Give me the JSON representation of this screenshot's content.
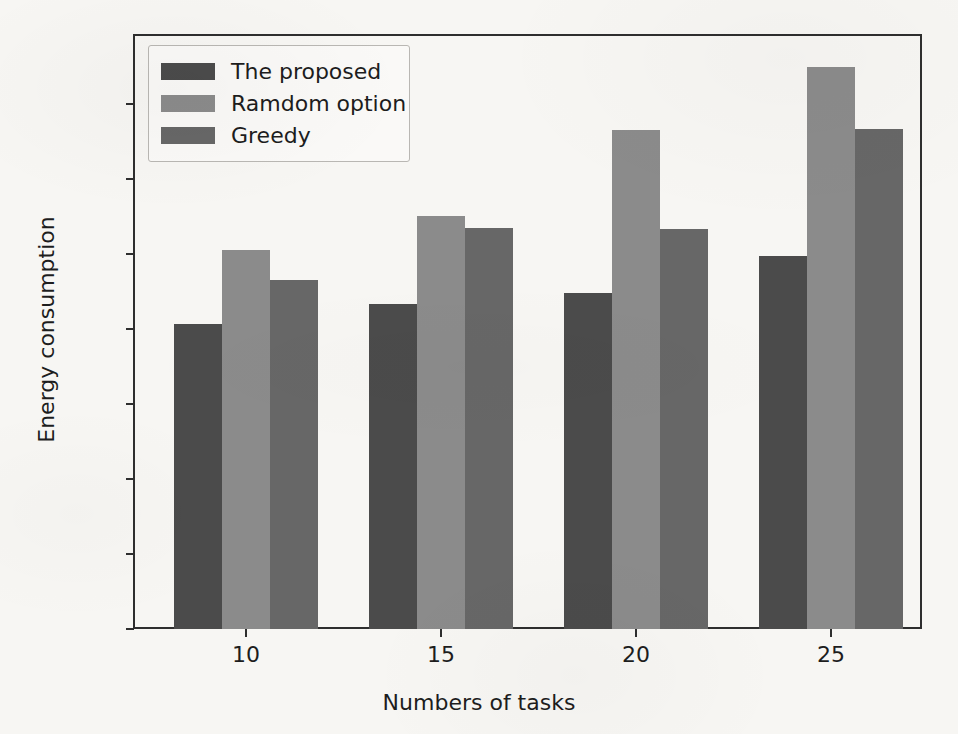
{
  "chart_data": {
    "type": "bar",
    "title": "",
    "xlabel": "Numbers of tasks",
    "ylabel": "Energy consumption",
    "categories": [
      "10",
      "15",
      "20",
      "25"
    ],
    "series": [
      {
        "name": "The proposed",
        "color": "#4b4b4b",
        "values": [
          2035,
          2170,
          2240,
          2490
        ]
      },
      {
        "name": "Ramdom option",
        "color": "#8b8b8b",
        "values": [
          2525,
          2755,
          3325,
          3750
        ]
      },
      {
        "name": "Greedy",
        "color": "#676767",
        "values": [
          2325,
          2675,
          2670,
          3335
        ]
      }
    ],
    "ylim": [
      0,
      3750
    ],
    "yticks": [
      "0",
      "500",
      "1000",
      "1500",
      "2000",
      "2500",
      "3000",
      "3500"
    ],
    "ytick_values": [
      0,
      500,
      1000,
      1500,
      2000,
      2500,
      3000,
      3500
    ],
    "grid": false,
    "legend_position": "upper left",
    "axis_color": "#2e2e2e",
    "background_color": "#f7f6f3"
  },
  "legend": {
    "entries": [
      {
        "label": "The proposed",
        "swatch": "#4b4b4b"
      },
      {
        "label": "Ramdom option",
        "swatch": "#8b8b8b"
      },
      {
        "label": "Greedy",
        "swatch": "#676767"
      }
    ]
  }
}
